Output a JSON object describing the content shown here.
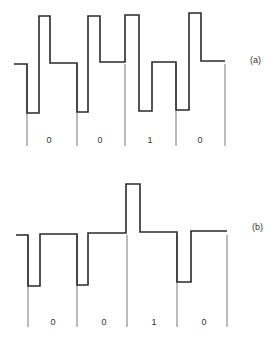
{
  "panels": [
    {
      "label": "(a)",
      "bits": [
        "0",
        "0",
        "1",
        "0"
      ],
      "waveform_points": [
        [
          14,
          64
        ],
        [
          27,
          64
        ],
        [
          27,
          113
        ],
        [
          39,
          113
        ],
        [
          39,
          16
        ],
        [
          50,
          16
        ],
        [
          50,
          63
        ],
        [
          77,
          63
        ],
        [
          77,
          112
        ],
        [
          88,
          112
        ],
        [
          88,
          16
        ],
        [
          100,
          16
        ],
        [
          100,
          62
        ],
        [
          125,
          62
        ],
        [
          125,
          15
        ],
        [
          139,
          15
        ],
        [
          139,
          111
        ],
        [
          152,
          111
        ],
        [
          152,
          62
        ],
        [
          176,
          62
        ],
        [
          176,
          110
        ],
        [
          189,
          110
        ],
        [
          189,
          13
        ],
        [
          201,
          13
        ],
        [
          201,
          61
        ],
        [
          225,
          61
        ]
      ],
      "boundaries_x": [
        27,
        77,
        125,
        176,
        225
      ],
      "boundary_y": [
        64,
        146
      ],
      "bit_label_x": [
        49,
        100,
        150,
        200
      ],
      "bit_label_y": 143,
      "panel_label_pos": [
        250,
        63
      ]
    },
    {
      "label": "(b)",
      "bits": [
        "0",
        "0",
        "1",
        "0"
      ],
      "waveform_points": [
        [
          16,
          235
        ],
        [
          28,
          235
        ],
        [
          28,
          286
        ],
        [
          40,
          286
        ],
        [
          40,
          234
        ],
        [
          77,
          234
        ],
        [
          77,
          285
        ],
        [
          88,
          285
        ],
        [
          88,
          233
        ],
        [
          126,
          233
        ],
        [
          126,
          184
        ],
        [
          140,
          184
        ],
        [
          140,
          232
        ],
        [
          177,
          232
        ],
        [
          177,
          282
        ],
        [
          191,
          282
        ],
        [
          191,
          231
        ],
        [
          227,
          231
        ]
      ],
      "boundaries_x": [
        28,
        77,
        127,
        177,
        227
      ],
      "boundary_y": [
        235,
        327
      ],
      "bit_label_x": [
        53,
        104,
        154,
        204
      ],
      "bit_label_y": 325,
      "panel_label_pos": [
        252,
        230
      ]
    }
  ],
  "colors": {
    "stroke": "#2a2a2a",
    "boundary": "#555555",
    "text": "#333333",
    "background": "#ffffff"
  }
}
